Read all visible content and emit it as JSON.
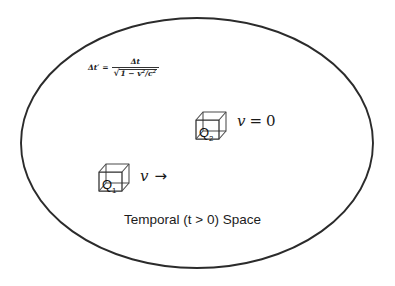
{
  "figure": {
    "background_color": "#ffffff",
    "stroke_color": "#2b2b2b",
    "text_color": "#1c1c1c"
  },
  "region": {
    "shape": "ellipse",
    "caption": "Temporal (t > 0) Space"
  },
  "formula": {
    "lhs": "Δt′",
    "equals": "=",
    "numerator": "Δt",
    "radical_sign": "√",
    "denominator_radicand_pre": "1 − ",
    "denominator_v": "v",
    "denominator_v_exp": "2",
    "denominator_slash": "/",
    "denominator_c": "c",
    "denominator_c_exp": "2",
    "plain_text": "Δt′ = Δt / √(1 − v²/c²)"
  },
  "objects": [
    {
      "id": "q2",
      "label_base": "Q",
      "label_sub": "2",
      "velocity_text": "v = 0",
      "velocity_symbol": "v",
      "velocity_operator": "=",
      "velocity_value": "0",
      "state": "at rest"
    },
    {
      "id": "q1",
      "label_base": "Q",
      "label_sub": "1",
      "velocity_text": "v →",
      "velocity_symbol": "v",
      "velocity_arrow": "→",
      "state": "moving"
    }
  ]
}
